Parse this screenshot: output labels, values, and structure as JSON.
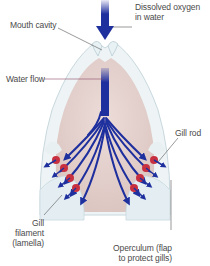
{
  "diagram": {
    "labels": {
      "dissolved_oxygen_1": "Dissolved oxygen",
      "dissolved_oxygen_2": "in water",
      "mouth_cavity": "Mouth cavity",
      "water_flow": "Water flow",
      "gill_rod": "Gill rod",
      "gill_filament_1": "Gill",
      "gill_filament_2": "filament",
      "gill_filament_3": "(lamella)",
      "operculum_1": "Operculum (flap",
      "operculum_2": "to protect gills)"
    },
    "colors": {
      "water_arrow": "#1e2f9e",
      "cavity_fill": "#e6d3cf",
      "body_outline": "#d8e6ea",
      "gill_red": "#c8303f",
      "label_text": "#4a4a4a"
    }
  }
}
